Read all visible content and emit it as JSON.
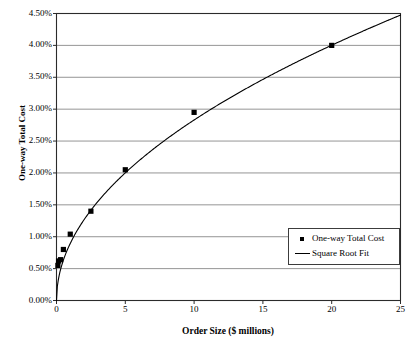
{
  "chart_data": {
    "type": "scatter",
    "title": "",
    "xlabel": "Order Size ($ millions)",
    "ylabel": "One-way Total Cost",
    "xlim": [
      0,
      25
    ],
    "ylim": [
      0,
      0.045
    ],
    "grid": true,
    "legend_position": "lower-right",
    "xticks": [
      "0",
      "5",
      "10",
      "15",
      "20",
      "25"
    ],
    "xtick_values": [
      0,
      5,
      10,
      15,
      20,
      25
    ],
    "yticks": [
      "0.00%",
      "0.50%",
      "1.00%",
      "1.50%",
      "2.00%",
      "2.50%",
      "3.00%",
      "3.50%",
      "4.00%",
      "4.50%"
    ],
    "ytick_values": [
      0.0,
      0.005,
      0.01,
      0.015,
      0.02,
      0.025,
      0.03,
      0.035,
      0.04,
      0.045
    ],
    "series": [
      {
        "name": "One-way Total Cost",
        "type": "scatter",
        "marker": "square",
        "color": "#000000",
        "points": [
          {
            "x": 0.1,
            "y": 0.0055
          },
          {
            "x": 0.15,
            "y": 0.0062
          },
          {
            "x": 0.3,
            "y": 0.0064
          },
          {
            "x": 0.5,
            "y": 0.008
          },
          {
            "x": 1.0,
            "y": 0.0104
          },
          {
            "x": 2.5,
            "y": 0.014
          },
          {
            "x": 5.0,
            "y": 0.0205
          },
          {
            "x": 10.0,
            "y": 0.0295
          },
          {
            "x": 20.0,
            "y": 0.04
          }
        ]
      },
      {
        "name": "Square Root Fit",
        "type": "line",
        "color": "#000000",
        "formula_coefficient": 0.00895,
        "formula": "y = 0.895% * sqrt(x)"
      }
    ],
    "legend": [
      {
        "label": "One-way Total Cost",
        "marker": "square"
      },
      {
        "label": "Square Root Fit",
        "marker": "line"
      }
    ]
  }
}
